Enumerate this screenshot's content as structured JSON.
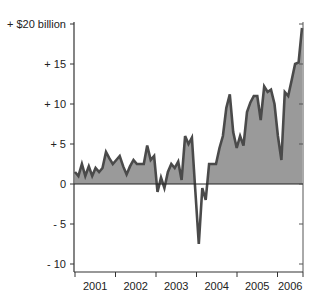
{
  "chart_data": {
    "type": "area",
    "title": "",
    "xlabel": "",
    "ylabel": "$ billion",
    "ylim": [
      -11,
      20
    ],
    "grid": false,
    "legend": null,
    "y_ticks": [
      {
        "value": 20,
        "label": "+ $20 billion"
      },
      {
        "value": 15,
        "label": "+ 15"
      },
      {
        "value": 10,
        "label": "+ 10"
      },
      {
        "value": 5,
        "label": "+ 5"
      },
      {
        "value": 0,
        "label": "0"
      },
      {
        "value": -5,
        "label": "- 5"
      },
      {
        "value": -10,
        "label": "- 10"
      }
    ],
    "x_ticks": [
      "2001",
      "2002",
      "2003",
      "2004",
      "2005",
      "2006"
    ],
    "x_start": "2001-01",
    "frequency": "monthly",
    "series": [
      {
        "name": "Monthly value",
        "values": [
          1.5,
          1.0,
          2.5,
          1.0,
          2.2,
          1.0,
          2.0,
          1.5,
          2.0,
          4.0,
          3.2,
          2.5,
          3.0,
          3.5,
          2.2,
          1.2,
          2.2,
          3.0,
          2.5,
          2.5,
          2.5,
          4.8,
          3.0,
          3.5,
          -1.0,
          0.8,
          -0.5,
          1.5,
          2.5,
          2.0,
          2.8,
          0.5,
          6.0,
          5.0,
          5.8,
          -1.0,
          -7.5,
          -0.5,
          -2.0,
          2.5,
          2.5,
          2.5,
          4.5,
          6.0,
          9.5,
          11.2,
          6.5,
          4.5,
          6.0,
          4.8,
          9.0,
          10.2,
          11.0,
          11.0,
          8.0,
          12.2,
          11.5,
          11.8,
          10.0,
          6.0,
          3.0,
          11.5,
          11.0,
          13.0,
          15.0,
          15.2,
          19.5
        ]
      }
    ]
  }
}
